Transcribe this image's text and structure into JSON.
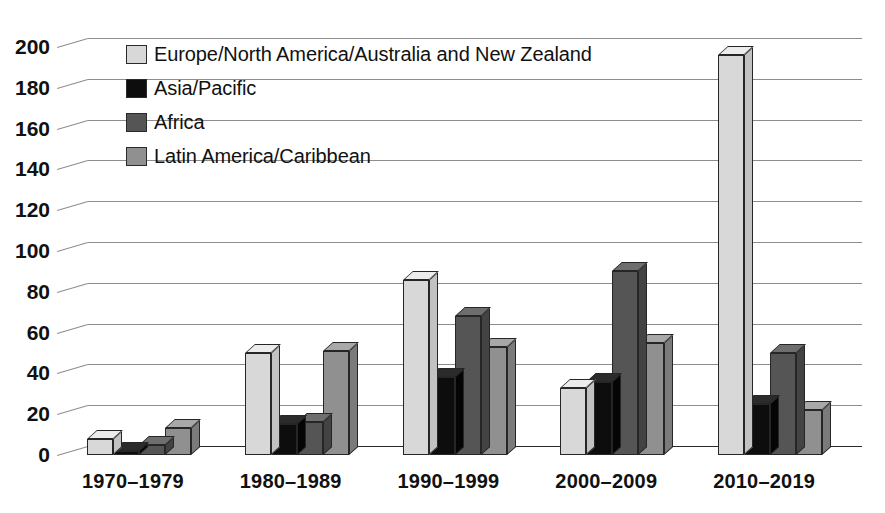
{
  "chart_data": {
    "type": "bar",
    "title": "",
    "xlabel": "",
    "ylabel": "",
    "ylim": [
      0,
      200
    ],
    "yticks": [
      0,
      20,
      40,
      60,
      80,
      100,
      120,
      140,
      160,
      180,
      200
    ],
    "grid": true,
    "legend_position": "top-left",
    "style": "3d-grouped-bars",
    "categories": [
      "1970–1979",
      "1980–1989",
      "1990–1999",
      "2000–2009",
      "2010–2019"
    ],
    "series": [
      {
        "name": "Europe/North America/Australia and New Zealand",
        "color": "#d8d8d8",
        "values": [
          8,
          50,
          86,
          33,
          196
        ]
      },
      {
        "name": "Asia/Pacific",
        "color": "#0d0d0d",
        "values": [
          2,
          15,
          38,
          36,
          25
        ]
      },
      {
        "name": "Africa",
        "color": "#555555",
        "values": [
          5,
          16,
          68,
          90,
          50
        ]
      },
      {
        "name": "Latin America/Caribbean",
        "color": "#909090",
        "values": [
          13,
          51,
          53,
          55,
          22
        ]
      }
    ]
  }
}
